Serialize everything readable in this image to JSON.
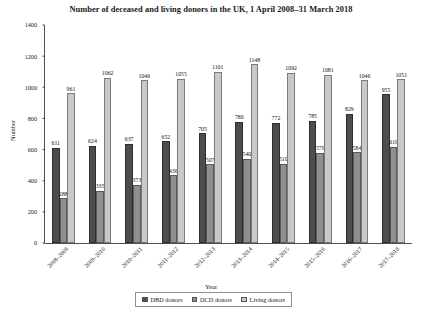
{
  "chart_data": {
    "type": "bar",
    "title": "Number of deceased and living donors in the UK, 1 April 2008–31 March 2018",
    "xlabel": "Year",
    "ylabel": "Number",
    "ylim": [
      0,
      1400
    ],
    "ytick_step": 200,
    "yticks": [
      "0",
      "200",
      "400",
      "600",
      "800",
      "1000",
      "1200",
      "1400"
    ],
    "grid": false,
    "legend_position": "bottom",
    "categories": [
      "2008–2009",
      "2009–2010",
      "2010–2011",
      "2011–2012",
      "2012–2013",
      "2013–2014",
      "2014–2015",
      "2015–2016",
      "2016–2017",
      "2017–2018"
    ],
    "series": [
      {
        "name": "DBD donors",
        "color": "#4d4d4d",
        "values": [
          611,
          624,
          637,
          652,
          705,
          780,
          772,
          785,
          829,
          955
        ]
      },
      {
        "name": "DCD donors",
        "color": "#8f8f8f",
        "values": [
          288,
          335,
          373,
          436,
          507,
          540,
          510,
          579,
          584,
          619
        ]
      },
      {
        "name": "Living donors",
        "color": "#c9c9c9",
        "values": [
          961,
          1062,
          1046,
          1055,
          1101,
          1148,
          1092,
          1081,
          1046,
          1051
        ]
      }
    ]
  },
  "legend": {
    "items": [
      {
        "label": "DBD donors"
      },
      {
        "label": "DCD donors"
      },
      {
        "label": "Living donors"
      }
    ]
  }
}
